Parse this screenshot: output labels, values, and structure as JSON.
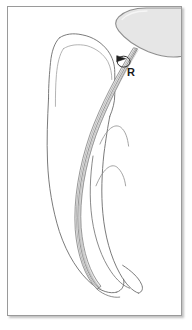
{
  "figure": {
    "domain": "anatomical-line-drawing",
    "frame": {
      "border_color": "#9a9a9a",
      "background_color": "#ffffff",
      "shadow_color": "#787878"
    },
    "palette": {
      "outline_dark": "#3a3a3a",
      "outline_mid": "#6e6e6e",
      "outline_light": "#a8a8a8",
      "instrument_fill": "#e8e8e8",
      "handpiece_fill": "#e6e6e6",
      "handpiece_stroke": "#8f8f8f",
      "label_color": "#1a1a1a"
    },
    "labels": [
      {
        "id": "reference-point",
        "text": "R",
        "x": 119,
        "y": 60,
        "description": "reference-point marker on instrument shaft"
      }
    ],
    "parts": [
      {
        "name": "tooth-crown-outline",
        "type": "outline"
      },
      {
        "name": "pulp-chamber-outline",
        "type": "outline"
      },
      {
        "name": "tooth-root-outline",
        "type": "outline"
      },
      {
        "name": "root-canal-curve",
        "type": "outline"
      },
      {
        "name": "root-apex",
        "type": "outline"
      },
      {
        "name": "endodontic-file-shaft",
        "type": "instrument"
      },
      {
        "name": "endodontic-file-flutes",
        "type": "instrument"
      },
      {
        "name": "handpiece-head",
        "type": "instrument"
      },
      {
        "name": "rubber-stop-marker",
        "type": "marker"
      },
      {
        "name": "reference-arrow",
        "type": "marker"
      },
      {
        "name": "bone-contour-upper",
        "type": "outline"
      },
      {
        "name": "bone-contour-lower",
        "type": "outline"
      }
    ]
  }
}
